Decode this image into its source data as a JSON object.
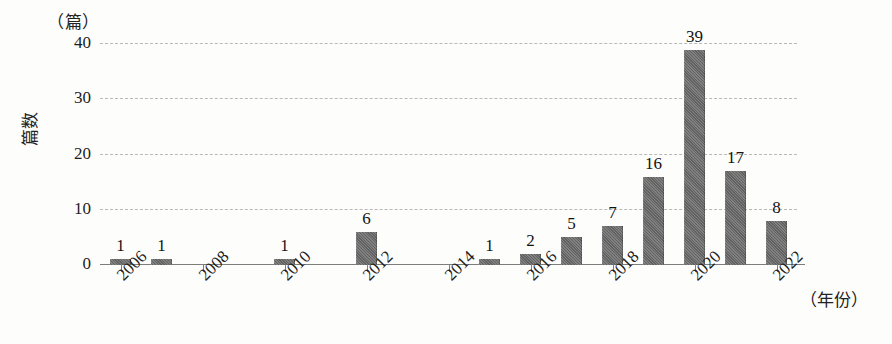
{
  "chart_data": {
    "type": "bar",
    "title": "",
    "subtitle": "",
    "xlabel": "（年份）",
    "ylabel": "篇数",
    "y_unit_label": "（篇）",
    "categories": [
      "2006",
      "2007",
      "2008",
      "2009",
      "2010",
      "2011",
      "2012",
      "2013",
      "2014",
      "2015",
      "2016",
      "2017",
      "2018",
      "2019",
      "2020",
      "2021",
      "2022"
    ],
    "values": [
      1,
      1,
      0,
      0,
      1,
      0,
      6,
      0,
      0,
      1,
      2,
      5,
      7,
      16,
      39,
      17,
      8
    ],
    "value_labels": [
      "1",
      "1",
      "",
      "",
      "1",
      "",
      "6",
      "",
      "",
      "1",
      "2",
      "5",
      "7",
      "16",
      "39",
      "17",
      "8"
    ],
    "x_tick_labels": [
      "2006",
      "2008",
      "2010",
      "2012",
      "2014",
      "2016",
      "2018",
      "2020",
      "2022"
    ],
    "y_tick_labels": [
      "0",
      "10",
      "20",
      "30",
      "40"
    ],
    "y_ticks": [
      0,
      10,
      20,
      30,
      40
    ],
    "ylim": [
      0,
      44
    ],
    "grid": true,
    "grid_axis": "y",
    "legend": false,
    "legend_position": "none",
    "bar_color": "#6d6d6d",
    "gridline_color": "#b9b9b9",
    "axis_color": "#7d7d7d",
    "text_color": "#1a1a1a"
  }
}
